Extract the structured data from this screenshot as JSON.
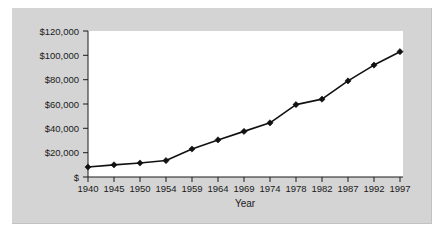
{
  "figure": {
    "background_color": "#d4d4d4",
    "plot_background_color": "#ffffff",
    "line_color": "#111111"
  },
  "chart_data": {
    "type": "line",
    "title": "",
    "subtitle": "",
    "xlabel": "Year",
    "ylabel": "",
    "categories": [
      "1940",
      "1945",
      "1950",
      "1954",
      "1959",
      "1964",
      "1969",
      "1974",
      "1978",
      "1982",
      "1987",
      "1992",
      "1997"
    ],
    "values": [
      8200,
      10000,
      11500,
      13500,
      23000,
      30500,
      37500,
      44500,
      59500,
      64000,
      79000,
      92000,
      103000
    ],
    "series": [
      {
        "name": "",
        "values": [
          8200,
          10000,
          11500,
          13500,
          23000,
          30500,
          37500,
          44500,
          59500,
          64000,
          79000,
          92000,
          103000
        ]
      }
    ],
    "ylim": [
      0,
      120000
    ],
    "ytick_values": [
      0,
      20000,
      40000,
      60000,
      80000,
      100000,
      120000
    ],
    "ytick_labels": [
      "$",
      "$20,000",
      "$40,000",
      "$60,000",
      "$80,000",
      "$100,000",
      "$120,000"
    ],
    "xtick_labels": [
      "1940",
      "1945",
      "1950",
      "1954",
      "1959",
      "1964",
      "1969",
      "1974",
      "1978",
      "1982",
      "1987",
      "1992",
      "1997"
    ],
    "grid": false,
    "legend": false,
    "legend_position": "none",
    "marker": "diamond",
    "annotations": []
  }
}
